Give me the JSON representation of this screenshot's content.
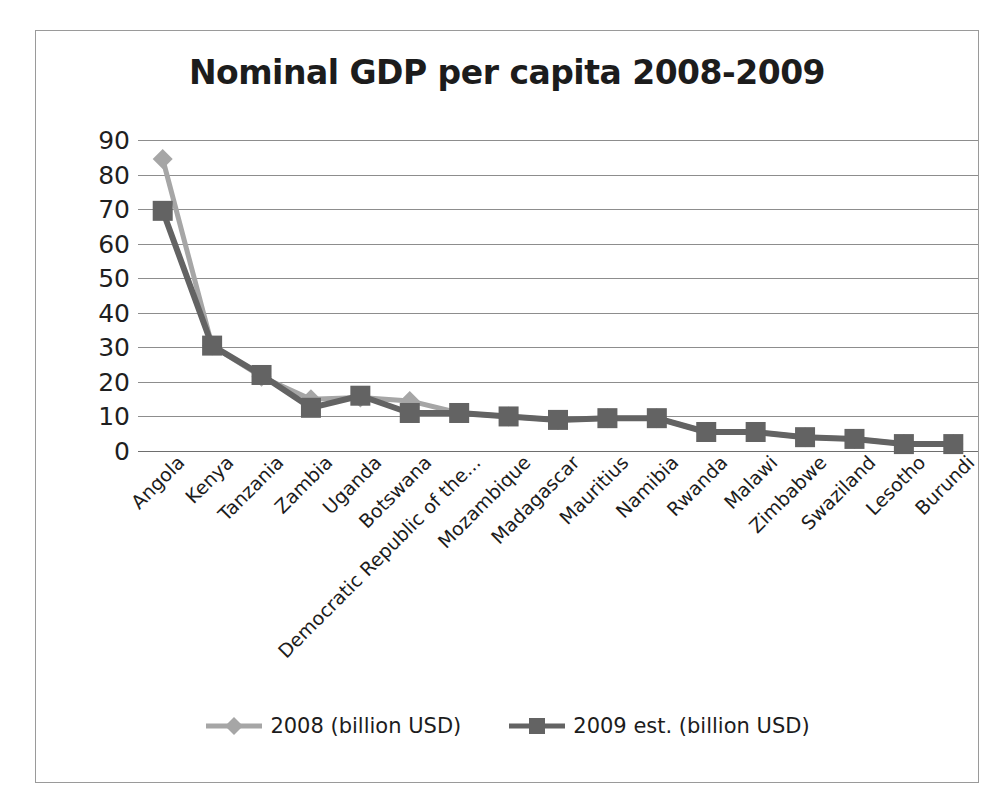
{
  "chart_data": {
    "type": "line",
    "title": "Nominal GDP per capita 2008-2009",
    "xlabel": "",
    "ylabel": "",
    "ylim": [
      0,
      90
    ],
    "ytick_step": 10,
    "yticks": [
      "90",
      "80",
      "70",
      "60",
      "50",
      "40",
      "30",
      "20",
      "10",
      "0"
    ],
    "grid": true,
    "legend_position": "bottom-center",
    "categories": [
      "Angola",
      "Kenya",
      "Tanzania",
      "Zambia",
      "Uganda",
      "Botswana",
      "Democratic Republic of the...",
      "Mozambique",
      "Madagascar",
      "Mauritius",
      "Namibia",
      "Rwanda",
      "Malawi",
      "Zimbabwe",
      "Swaziland",
      "Lesotho",
      "Burundi"
    ],
    "series": [
      {
        "name": "2008 (billion USD)",
        "color": "#a6a6a6",
        "marker": "diamond",
        "values": [
          84.5,
          30.5,
          21.5,
          15.0,
          15.5,
          14.5,
          11.0,
          10.0,
          9.0,
          9.5,
          9.5,
          5.5,
          5.5,
          4.0,
          3.5,
          2.0,
          2.0
        ]
      },
      {
        "name": "2009 est. (billion USD)",
        "color": "#636363",
        "marker": "square",
        "values": [
          69.5,
          30.5,
          22.0,
          12.5,
          16.0,
          11.0,
          11.0,
          10.0,
          9.0,
          9.5,
          9.5,
          5.5,
          5.5,
          4.0,
          3.5,
          2.0,
          2.0
        ]
      }
    ]
  },
  "legend": {
    "entries": [
      {
        "label": "2008 (billion USD)"
      },
      {
        "label": "2009 est. (billion USD)"
      }
    ]
  },
  "colors": {
    "series_2008": "#a6a6a6",
    "series_2009": "#636363",
    "gridline": "#8d8d8d",
    "frame_border": "#9a9a9a",
    "text": "#1c1c1c"
  }
}
